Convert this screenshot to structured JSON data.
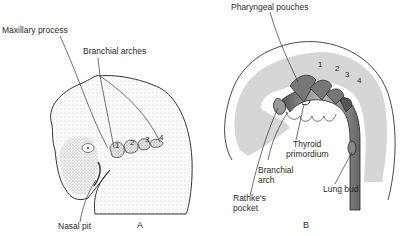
{
  "panel_a": {
    "letter": "A",
    "labels": {
      "maxillary_process": "Maxillary process",
      "branchial_arches": "Branchial arches",
      "nasal_pit": "Nasal pit"
    },
    "arch_numbers": [
      "1",
      "2",
      "3",
      "4"
    ]
  },
  "panel_b": {
    "letter": "B",
    "labels": {
      "pharyngeal_pouches": "Pharyngeal pouches",
      "thyroid_primordium_line1": "Thyroid",
      "thyroid_primordium_line2": "primordium",
      "branchial_arch_line1": "Branchial",
      "branchial_arch_line2": "arch",
      "rathkes_pocket_line1": "Rathke's",
      "rathkes_pocket_line2": "pocket",
      "lung_bud": "Lung bud"
    },
    "pouch_numbers": [
      "1",
      "2",
      "3",
      "4"
    ]
  },
  "colors": {
    "ink": "#2a2a2a",
    "gray_fill": "#d6d6d6",
    "stipple": "#8a8a8a"
  }
}
